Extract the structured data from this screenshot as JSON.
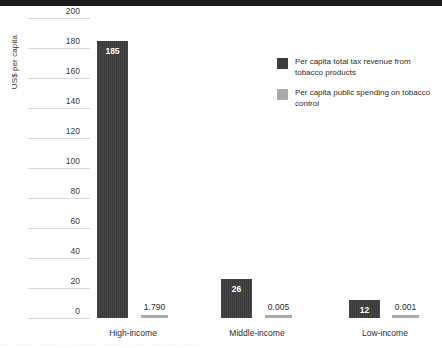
{
  "chart_data": {
    "type": "bar",
    "title": "",
    "xlabel": "",
    "ylabel": "US$ per capita",
    "ylim": [
      0,
      200
    ],
    "yticks": [
      200,
      180,
      160,
      140,
      120,
      100,
      80,
      60,
      40,
      20,
      0
    ],
    "categories": [
      "High-income",
      "Middle-income",
      "Low-income"
    ],
    "grid": true,
    "legend_position": "upper right",
    "series": [
      {
        "name": "Per capita total tax revenue from tobacco products",
        "color": "#3c3c3c",
        "values": [
          185,
          26,
          12
        ],
        "labels": [
          "185",
          "26",
          "12"
        ]
      },
      {
        "name": "Per capita public spending on tobacco control",
        "color": "#a9a9a9",
        "values": [
          1.79,
          0.005,
          0.001
        ],
        "labels": [
          "1.790",
          "0.005",
          "0.001"
        ]
      }
    ]
  },
  "axis": {
    "y_title": "US$ per capita"
  },
  "legend": {
    "items": [
      {
        "label": "Per capita total tax revenue from tobacco products",
        "swatch": "dark"
      },
      {
        "label": "Per capita public spending on tobacco control",
        "swatch": "light"
      }
    ]
  },
  "footer": {
    "cropped_text": "·  ·· ·  ···  · ·· ·  ·· ···· ·  ·· ·   ·· ·· ··· · ·  ··· · ·· ·· ·  ·· ·· ·  ·· ·· ·· ·· ·  ·· ··· ·"
  }
}
